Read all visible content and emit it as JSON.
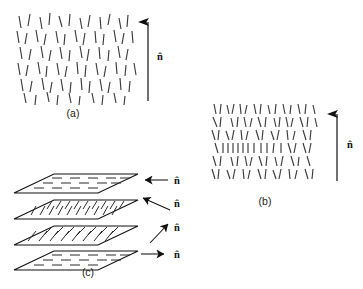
{
  "figure": {
    "background_color": "#ffffff",
    "ink_color": "#111111",
    "rod_color": "#3b3b3b"
  },
  "panels": [
    {
      "id": "a",
      "label": "(a)",
      "phase": "nematic",
      "description": "Rods with orientational order along the director but no positional order",
      "director_label": "n̂",
      "director_orientation": "vertical-up",
      "label_position": {
        "x": 73,
        "y": 117
      },
      "director_label_position": {
        "x": 160,
        "y": 60
      },
      "arrow": {
        "x": 148,
        "y_start": 101,
        "y_end": 16
      }
    },
    {
      "id": "b",
      "label": "(b)",
      "phase": "smectic",
      "description": "Rods organised in distinct layers perpendicular to the director",
      "director_label": "n̂",
      "director_orientation": "vertical-up",
      "label_position": {
        "x": 265,
        "y": 205
      },
      "director_label_position": {
        "x": 350,
        "y": 148
      },
      "arrow": {
        "x": 337,
        "y_start": 181,
        "y_end": 108
      },
      "layer_count": 7
    },
    {
      "id": "c",
      "label": "(c)",
      "phase": "cholesteric",
      "description": "Stacked planes in which the director rotates progressively from layer to layer",
      "label_position": {
        "x": 88,
        "y": 276
      },
      "planes": [
        {
          "index": 0,
          "director_label": "n̂",
          "director_orientation": "left",
          "rod_angle_deg": 0,
          "director_label_position": {
            "x": 177,
            "y": 184
          },
          "arrow": {
            "type": "horizontal-left",
            "x_start": 168,
            "x_end": 141,
            "y": 180
          }
        },
        {
          "index": 1,
          "director_label": "n̂",
          "director_orientation": "up-left-diagonal",
          "rod_angle_deg": 60,
          "director_label_position": {
            "x": 177,
            "y": 207
          },
          "arrow": {
            "type": "diagonal",
            "x_start": 170,
            "y_start": 210,
            "x_end": 139,
            "y_end": 197
          }
        },
        {
          "index": 2,
          "director_label": "n̂",
          "director_orientation": "up-right-diagonal",
          "rod_angle_deg": 40,
          "director_label_position": {
            "x": 177,
            "y": 231
          },
          "arrow": {
            "type": "diagonal",
            "x_start": 150,
            "y_start": 243,
            "x_end": 170,
            "y_end": 222
          }
        },
        {
          "index": 3,
          "director_label": "n̂",
          "director_orientation": "right",
          "rod_angle_deg": 0,
          "director_label_position": {
            "x": 177,
            "y": 258
          },
          "arrow": {
            "type": "horizontal-right",
            "x_start": 141,
            "x_end": 168,
            "y": 254
          }
        }
      ]
    }
  ]
}
